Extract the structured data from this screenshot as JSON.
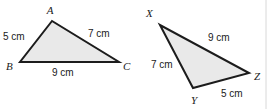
{
  "figure": {
    "canvas": {
      "width": 275,
      "height": 109,
      "background": "#ffffff"
    },
    "style": {
      "fill_color": "#e9e9e9",
      "stroke_color": "#1c1c1c",
      "stroke_width": 2,
      "label_color": "#1a1a1a",
      "divider_color": "#d8d8d8"
    },
    "divider": {
      "x": 266,
      "y1": 0,
      "y2": 109
    },
    "triangles": [
      {
        "id": "triangle-abc",
        "name": "Triangle ABC",
        "points": "52,21 20,62 119,62",
        "vertices": [
          {
            "key": "A",
            "label": "A",
            "point_x": 52,
            "point_y": 21,
            "label_x": 50,
            "label_y": 14
          },
          {
            "key": "B",
            "label": "B",
            "point_x": 20,
            "point_y": 62,
            "label_x": 6,
            "label_y": 70
          },
          {
            "key": "C",
            "label": "C",
            "point_x": 119,
            "point_y": 62,
            "label_x": 123,
            "label_y": 70
          }
        ],
        "sides": [
          {
            "key": "AB",
            "label": "5 cm",
            "x": 3,
            "y": 40,
            "anchor": "start"
          },
          {
            "key": "AC",
            "label": "7 cm",
            "x": 88,
            "y": 37,
            "anchor": "start"
          },
          {
            "key": "BC",
            "label": "9 cm",
            "x": 52,
            "y": 76,
            "anchor": "start"
          }
        ]
      },
      {
        "id": "triangle-xyz",
        "name": "Triangle XYZ",
        "points": "160,25 193,88 249,73",
        "vertices": [
          {
            "key": "X",
            "label": "X",
            "point_x": 160,
            "point_y": 25,
            "label_x": 146,
            "label_y": 17
          },
          {
            "key": "Y",
            "label": "Y",
            "point_x": 193,
            "point_y": 88,
            "label_x": 191,
            "label_y": 104
          },
          {
            "key": "Z",
            "label": "Z",
            "point_x": 249,
            "point_y": 73,
            "label_x": 254,
            "label_y": 80
          }
        ],
        "sides": [
          {
            "key": "XZ",
            "label": "9 cm",
            "x": 208,
            "y": 41,
            "anchor": "start"
          },
          {
            "key": "XY",
            "label": "7 cm",
            "x": 151,
            "y": 68,
            "anchor": "start"
          },
          {
            "key": "YZ",
            "label": "5 cm",
            "x": 221,
            "y": 97,
            "anchor": "start"
          }
        ]
      }
    ]
  }
}
